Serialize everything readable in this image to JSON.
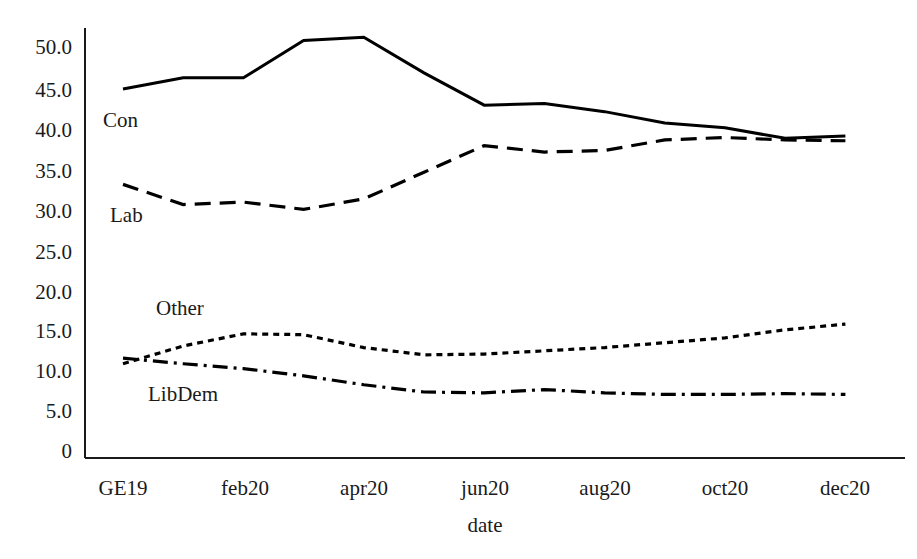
{
  "chart_data": {
    "type": "line",
    "title": "",
    "xlabel": "date",
    "ylabel": "",
    "x": [
      "GE19",
      "jan20",
      "feb20",
      "mar20",
      "apr20",
      "may20",
      "jun20",
      "jul20",
      "aug20",
      "sep20",
      "oct20",
      "nov20",
      "dec20"
    ],
    "xtick_labels": [
      "GE19",
      "feb20",
      "apr20",
      "jun20",
      "aug20",
      "oct20",
      "dec20"
    ],
    "ytick_labels": [
      "50.0",
      "45.0",
      "40.0",
      "35.0",
      "30.0",
      "25.0",
      "20.0",
      "15.0",
      "10.0",
      "5.0",
      "0"
    ],
    "ylim": [
      0,
      52
    ],
    "grid": false,
    "legend_position": "inline-labels",
    "series": [
      {
        "name": "Con",
        "linestyle": "solid",
        "color": "#000000",
        "values": [
          44.8,
          46.2,
          46.2,
          50.8,
          51.2,
          46.8,
          42.8,
          43.0,
          42.0,
          40.6,
          40.0,
          38.7,
          39.0
        ]
      },
      {
        "name": "Lab",
        "linestyle": "dashed",
        "color": "#000000",
        "values": [
          33.0,
          30.5,
          30.8,
          29.9,
          31.2,
          34.5,
          37.8,
          37.0,
          37.2,
          38.5,
          38.8,
          38.5,
          38.4
        ]
      },
      {
        "name": "Other",
        "linestyle": "dotted",
        "color": "#000000",
        "values": [
          10.8,
          13.0,
          14.5,
          14.4,
          12.8,
          11.9,
          12.0,
          12.4,
          12.8,
          13.4,
          14.0,
          15.0,
          15.7
        ]
      },
      {
        "name": "LibDem",
        "linestyle": "dashdot",
        "color": "#000000",
        "values": [
          11.5,
          10.8,
          10.2,
          9.3,
          8.2,
          7.3,
          7.2,
          7.6,
          7.2,
          7.0,
          7.0,
          7.1,
          7.0
        ]
      }
    ],
    "series_labels": [
      {
        "text": "Con",
        "x": 103,
        "y": 110
      },
      {
        "text": "Lab",
        "x": 110,
        "y": 205
      },
      {
        "text": "Other",
        "x": 156,
        "y": 298
      },
      {
        "text": "LibDem",
        "x": 148,
        "y": 384
      }
    ]
  },
  "axes": {
    "y_ticks": [
      {
        "label": "50.0",
        "y": 47
      },
      {
        "label": "45.0",
        "y": 90
      },
      {
        "label": "40.0",
        "y": 130
      },
      {
        "label": "35.0",
        "y": 171
      },
      {
        "label": "30.0",
        "y": 211
      },
      {
        "label": "25.0",
        "y": 252
      },
      {
        "label": "20.0",
        "y": 292
      },
      {
        "label": "15.0",
        "y": 331
      },
      {
        "label": "10.0",
        "y": 371
      },
      {
        "label": "5.0",
        "y": 411
      },
      {
        "label": "0",
        "y": 451
      }
    ],
    "x_ticks": [
      {
        "label": "GE19",
        "x": 123
      },
      {
        "label": "feb20",
        "x": 245
      },
      {
        "label": "apr20",
        "x": 364
      },
      {
        "label": "jun20",
        "x": 485
      },
      {
        "label": "aug20",
        "x": 605
      },
      {
        "label": "oct20",
        "x": 725
      },
      {
        "label": "dec20",
        "x": 845
      }
    ],
    "x_axis_title": "date"
  }
}
